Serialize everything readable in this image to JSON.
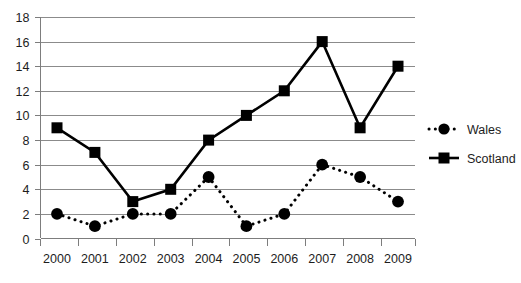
{
  "chart_data": {
    "type": "line",
    "title": "",
    "subtitle": "",
    "xlabel": "",
    "ylabel": "",
    "categories": [
      "2000",
      "2001",
      "2002",
      "2003",
      "2004",
      "2005",
      "2006",
      "2007",
      "2008",
      "2009"
    ],
    "x": [
      2000,
      2001,
      2002,
      2003,
      2004,
      2005,
      2006,
      2007,
      2008,
      2009
    ],
    "series": [
      {
        "name": "Wales",
        "values": [
          2,
          1,
          2,
          2,
          5,
          1,
          2,
          6,
          5,
          3
        ],
        "marker": "circle",
        "linestyle": "dotted",
        "color": "#000000"
      },
      {
        "name": "Scotland",
        "values": [
          9,
          7,
          3,
          4,
          8,
          10,
          12,
          16,
          9,
          14
        ],
        "marker": "square",
        "linestyle": "solid",
        "color": "#000000"
      }
    ],
    "ylim": [
      0,
      18
    ],
    "ytick_step": 2,
    "yticks": [
      0,
      2,
      4,
      6,
      8,
      10,
      12,
      14,
      16,
      18
    ],
    "ytick_labels": [
      "0",
      "2",
      "4",
      "6",
      "8",
      "10",
      "12",
      "14",
      "16",
      "18"
    ],
    "xlim": [
      2000,
      2009
    ],
    "grid": "horizontal",
    "legend_position": "right",
    "legend_entries": [
      "Wales",
      "Scotland"
    ],
    "background_color": "#ffffff",
    "axis_color": "#7d7d7d",
    "grid_color": "#8b8b8b"
  },
  "legend": {
    "wales_label": "Wales",
    "scotland_label": "Scotland"
  }
}
